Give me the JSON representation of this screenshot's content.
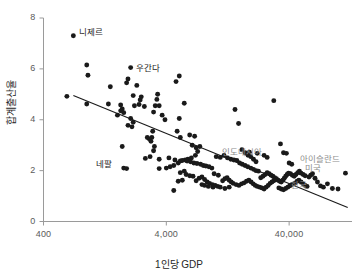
{
  "chart_data": {
    "type": "scatter",
    "title": "",
    "xlabel": "1인당 GDP",
    "ylabel": "합계출산율",
    "xscale": "log",
    "xlim": [
      400,
      130000
    ],
    "ylim": [
      0,
      8
    ],
    "xticks": [
      "400",
      "4,000",
      "40,000"
    ],
    "xtick_values": [
      400,
      4000,
      40000
    ],
    "yticks": [
      "0",
      "2",
      "4",
      "6",
      "8"
    ],
    "ytick_values": [
      0,
      2,
      4,
      6,
      8
    ],
    "grid": false,
    "legend": null,
    "point_color": "#1a1a1a",
    "trendline_color": "#1a1a1a",
    "annotation_color_dark": "#1a1a1a",
    "annotation_color_gray": "#8c8c8c",
    "trendline": {
      "x_start": 700,
      "y_start": 4.95,
      "x_end": 120000,
      "y_end": 0.55
    },
    "annotations": [
      {
        "label": "니제르",
        "x": 700,
        "y": 7.3,
        "color": "dark",
        "dx": 6,
        "dy": -4
      },
      {
        "label": "우간다",
        "x": 2100,
        "y": 5.85,
        "color": "dark",
        "dx": 4,
        "dy": -5
      },
      {
        "label": "네팔",
        "x": 1750,
        "y": 2.1,
        "color": "dark",
        "dx": -26,
        "dy": -4
      },
      {
        "label": "인도네시아",
        "x": 11000,
        "y": 2.55,
        "color": "gray",
        "dx": 2,
        "dy": -5
      },
      {
        "label": "아이슬란드",
        "x": 47000,
        "y": 2.25,
        "color": "gray",
        "dx": 2,
        "dy": -5
      },
      {
        "label": "미국",
        "x": 52000,
        "y": 1.95,
        "color": "gray",
        "dx": 2,
        "dy": -4
      },
      {
        "label": "한국",
        "x": 40000,
        "y": 1.3,
        "color": "gray",
        "dx": 2,
        "dy": -3
      }
    ],
    "points": [
      [
        700,
        7.3
      ],
      [
        900,
        6.15
      ],
      [
        920,
        5.75
      ],
      [
        1400,
        5.3
      ],
      [
        620,
        4.92
      ],
      [
        900,
        4.62
      ],
      [
        1350,
        4.62
      ],
      [
        1700,
        4.58
      ],
      [
        2050,
        6.05
      ],
      [
        1950,
        5.6
      ],
      [
        1900,
        5.45
      ],
      [
        2300,
        5.35
      ],
      [
        2150,
        4.95
      ],
      [
        2500,
        4.9
      ],
      [
        2450,
        4.78
      ],
      [
        2200,
        4.55
      ],
      [
        1750,
        4.42
      ],
      [
        1800,
        4.28
      ],
      [
        1700,
        4.35
      ],
      [
        1600,
        4.18
      ],
      [
        2050,
        4.05
      ],
      [
        2150,
        3.9
      ],
      [
        2100,
        3.72
      ],
      [
        1950,
        3.78
      ],
      [
        2400,
        4.6
      ],
      [
        2650,
        4.52
      ],
      [
        3400,
        5.0
      ],
      [
        3350,
        4.8
      ],
      [
        3250,
        4.55
      ],
      [
        3150,
        4.3
      ],
      [
        3500,
        4.55
      ],
      [
        3700,
        4.18
      ],
      [
        3900,
        4.0
      ],
      [
        3100,
        3.55
      ],
      [
        3050,
        3.3
      ],
      [
        2900,
        3.25
      ],
      [
        2800,
        3.3
      ],
      [
        3000,
        3.15
      ],
      [
        3200,
        2.95
      ],
      [
        3150,
        2.78
      ],
      [
        2950,
        2.55
      ],
      [
        2700,
        2.48
      ],
      [
        3500,
        2.45
      ],
      [
        4200,
        2.5
      ],
      [
        4700,
        2.42
      ],
      [
        5200,
        2.38
      ],
      [
        5000,
        2.3
      ],
      [
        4600,
        2.2
      ],
      [
        4300,
        2.15
      ],
      [
        4000,
        2.1
      ],
      [
        3500,
        2.08
      ],
      [
        1800,
        2.1
      ],
      [
        1900,
        2.08
      ],
      [
        1750,
        2.95
      ],
      [
        5100,
        5.72
      ],
      [
        4800,
        5.5
      ],
      [
        5600,
        4.65
      ],
      [
        5100,
        4.05
      ],
      [
        4900,
        3.55
      ],
      [
        5200,
        3.3
      ],
      [
        6200,
        3.4
      ],
      [
        6800,
        3.35
      ],
      [
        6500,
        3.0
      ],
      [
        7000,
        2.9
      ],
      [
        7500,
        2.95
      ],
      [
        7200,
        2.75
      ],
      [
        6900,
        2.6
      ],
      [
        6400,
        2.5
      ],
      [
        6000,
        2.45
      ],
      [
        5700,
        2.42
      ],
      [
        5400,
        2.4
      ],
      [
        5900,
        2.38
      ],
      [
        6300,
        2.35
      ],
      [
        6700,
        2.3
      ],
      [
        7100,
        2.28
      ],
      [
        7600,
        2.25
      ],
      [
        8000,
        2.2
      ],
      [
        8400,
        2.18
      ],
      [
        8900,
        2.15
      ],
      [
        9400,
        2.1
      ],
      [
        5600,
        1.98
      ],
      [
        5200,
        1.92
      ],
      [
        5800,
        1.85
      ],
      [
        6200,
        1.8
      ],
      [
        6600,
        1.78
      ],
      [
        5400,
        1.62
      ],
      [
        5000,
        1.58
      ],
      [
        4600,
        1.22
      ],
      [
        7000,
        1.6
      ],
      [
        7400,
        1.7
      ],
      [
        7800,
        1.75
      ],
      [
        8200,
        1.65
      ],
      [
        8600,
        1.55
      ],
      [
        9000,
        1.5
      ],
      [
        9500,
        1.45
      ],
      [
        10000,
        1.42
      ],
      [
        10500,
        1.38
      ],
      [
        11000,
        1.35
      ],
      [
        11500,
        1.6
      ],
      [
        12000,
        1.68
      ],
      [
        12500,
        1.72
      ],
      [
        13000,
        1.62
      ],
      [
        13500,
        1.55
      ],
      [
        14000,
        1.5
      ],
      [
        10200,
        2.55
      ],
      [
        11000,
        2.52
      ],
      [
        11800,
        2.6
      ],
      [
        12600,
        2.5
      ],
      [
        13400,
        2.45
      ],
      [
        14200,
        2.42
      ],
      [
        15000,
        2.4
      ],
      [
        15800,
        2.3
      ],
      [
        16600,
        2.25
      ],
      [
        17500,
        2.2
      ],
      [
        18400,
        2.15
      ],
      [
        19500,
        2.1
      ],
      [
        20500,
        2.05
      ],
      [
        21500,
        2.0
      ],
      [
        22500,
        1.98
      ],
      [
        14500,
        4.4
      ],
      [
        15500,
        3.85
      ],
      [
        16500,
        2.82
      ],
      [
        17500,
        2.7
      ],
      [
        18500,
        2.6
      ],
      [
        19500,
        2.55
      ],
      [
        20500,
        2.45
      ],
      [
        21500,
        2.35
      ],
      [
        14800,
        1.45
      ],
      [
        15600,
        1.42
      ],
      [
        16400,
        1.48
      ],
      [
        17200,
        1.52
      ],
      [
        18000,
        1.58
      ],
      [
        18800,
        1.62
      ],
      [
        19600,
        1.55
      ],
      [
        20400,
        1.48
      ],
      [
        21200,
        1.42
      ],
      [
        22000,
        1.38
      ],
      [
        23000,
        1.35
      ],
      [
        24000,
        1.32
      ],
      [
        25000,
        1.28
      ],
      [
        26000,
        1.35
      ],
      [
        27000,
        1.42
      ],
      [
        28000,
        1.5
      ],
      [
        29000,
        1.55
      ],
      [
        30000,
        1.6
      ],
      [
        31000,
        1.65
      ],
      [
        23500,
        1.72
      ],
      [
        24500,
        1.78
      ],
      [
        25500,
        1.85
      ],
      [
        26500,
        1.92
      ],
      [
        27500,
        1.88
      ],
      [
        28500,
        1.82
      ],
      [
        29500,
        1.78
      ],
      [
        30500,
        1.72
      ],
      [
        31500,
        1.68
      ],
      [
        32500,
        1.62
      ],
      [
        33500,
        1.58
      ],
      [
        34500,
        1.55
      ],
      [
        35500,
        1.62
      ],
      [
        36500,
        1.7
      ],
      [
        37500,
        1.78
      ],
      [
        38500,
        1.85
      ],
      [
        39500,
        1.9
      ],
      [
        41000,
        1.88
      ],
      [
        42500,
        1.82
      ],
      [
        44000,
        1.78
      ],
      [
        45500,
        1.85
      ],
      [
        47000,
        1.92
      ],
      [
        48500,
        1.98
      ],
      [
        50000,
        1.9
      ],
      [
        52000,
        1.85
      ],
      [
        54000,
        1.8
      ],
      [
        34000,
        3.05
      ],
      [
        30000,
        4.75
      ],
      [
        36000,
        2.7
      ],
      [
        38000,
        2.68
      ],
      [
        40000,
        2.3
      ],
      [
        42000,
        2.25
      ],
      [
        33000,
        1.32
      ],
      [
        34500,
        1.28
      ],
      [
        36000,
        1.25
      ],
      [
        37500,
        1.3
      ],
      [
        39000,
        1.35
      ],
      [
        40500,
        1.4
      ],
      [
        42000,
        1.45
      ],
      [
        43500,
        1.48
      ],
      [
        45000,
        1.52
      ],
      [
        46500,
        1.58
      ],
      [
        48000,
        1.62
      ],
      [
        50000,
        1.55
      ],
      [
        52000,
        1.48
      ],
      [
        54000,
        1.42
      ],
      [
        56000,
        1.38
      ],
      [
        58000,
        1.75
      ],
      [
        60000,
        1.82
      ],
      [
        62000,
        1.88
      ],
      [
        65000,
        1.7
      ],
      [
        68000,
        1.55
      ],
      [
        72000,
        1.4
      ],
      [
        76000,
        1.35
      ],
      [
        82000,
        1.48
      ],
      [
        90000,
        1.3
      ],
      [
        100000,
        1.28
      ],
      [
        115000,
        1.9
      ],
      [
        25000,
        2.6
      ],
      [
        26500,
        2.52
      ],
      [
        22000,
        2.68
      ],
      [
        19000,
        2.72
      ],
      [
        9800,
        1.88
      ],
      [
        10600,
        1.82
      ],
      [
        8800,
        1.38
      ],
      [
        9600,
        1.35
      ],
      [
        12000,
        1.3
      ],
      [
        13000,
        1.35
      ],
      [
        7800,
        1.45
      ],
      [
        8200,
        1.42
      ]
    ]
  }
}
